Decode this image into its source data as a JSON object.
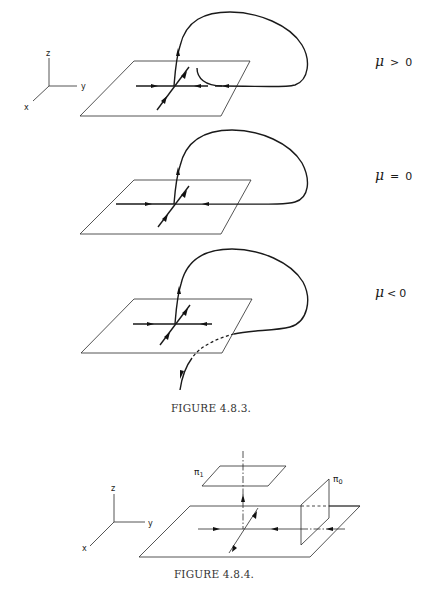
{
  "figures": [
    {
      "id": "figure-4-8-3",
      "caption": "FIGURE 4.8.3.",
      "axes": {
        "z": "z",
        "y": "y",
        "x": "x"
      },
      "panels": [
        {
          "condition_symbol": "μ",
          "condition_op": ">",
          "condition_value": "0"
        },
        {
          "condition_symbol": "μ",
          "condition_op": "=",
          "condition_value": "0"
        },
        {
          "condition_symbol": "μ",
          "condition_op": "<",
          "condition_value": "0"
        }
      ]
    },
    {
      "id": "figure-4-8-4",
      "caption": "FIGURE 4.8.4.",
      "axes": {
        "z": "z",
        "y": "y",
        "x": "x"
      },
      "section_labels": {
        "pi1_symbol": "π",
        "pi1_sub": "1",
        "pi0_symbol": "π",
        "pi0_sub": "0"
      }
    }
  ]
}
